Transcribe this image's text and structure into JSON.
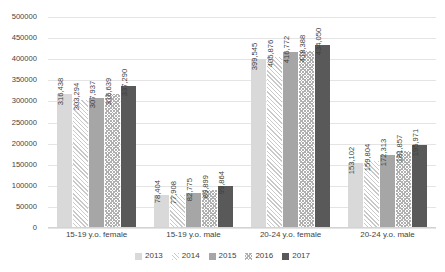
{
  "chart_data": {
    "type": "bar",
    "title": "",
    "subtitle": "",
    "xlabel": "",
    "ylabel": "",
    "ylim": [
      0,
      500000
    ],
    "ytick_step": 50000,
    "yticks": [
      "500000",
      "450000",
      "400000",
      "350000",
      "300000",
      "250000",
      "200000",
      "150000",
      "100000",
      "50000",
      "0"
    ],
    "grid": true,
    "legend_position": "bottom",
    "categories": [
      "15-19 y.o. female",
      "15-19 y.o. male",
      "20-24 y.o. female",
      "20-24 y.o. male"
    ],
    "series": [
      {
        "name": "2013",
        "swatch": "#d9d9d9",
        "pattern": "solid-light",
        "values": [
          316438,
          78404,
          399545,
          153102
        ],
        "labels": [
          "316,438",
          "78,404",
          "399,545",
          "153,102"
        ]
      },
      {
        "name": "2014",
        "swatch": "#c9c9c9",
        "pattern": "diagonal-hatch",
        "values": [
          303294,
          77908,
          405876,
          159804
        ],
        "labels": [
          "303,294",
          "77,908",
          "405,876",
          "159,804"
        ]
      },
      {
        "name": "2015",
        "swatch": "#a6a6a6",
        "pattern": "solid-medium",
        "values": [
          307937,
          82775,
          416772,
          172313
        ],
        "labels": [
          "307,937",
          "82,775",
          "416,772",
          "172,313"
        ]
      },
      {
        "name": "2016",
        "swatch": "#b0b0b0",
        "pattern": "checkered",
        "values": [
          316639,
          89899,
          418388,
          181857
        ],
        "labels": [
          "316,639",
          "89,899",
          "418,388",
          "181,857"
        ]
      },
      {
        "name": "2017",
        "swatch": "#595959",
        "pattern": "solid-dark",
        "values": [
          337290,
          99864,
          434050,
          195971
        ],
        "labels": [
          "337,290",
          "99,864",
          "434,050",
          "195,971"
        ]
      }
    ]
  },
  "colors": {
    "gridline": "#e4e4e4",
    "text": "#3f3f3f",
    "background": "#ffffff"
  }
}
